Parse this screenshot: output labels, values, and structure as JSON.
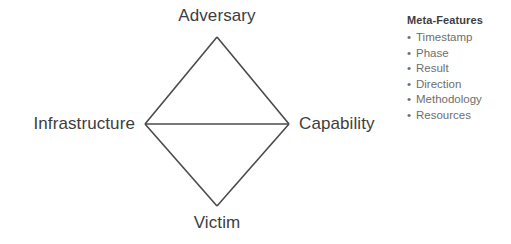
{
  "diagram": {
    "line_color": "#4a4a4c",
    "text_color": "#3d3d3f",
    "background_color": "#ffffff",
    "nodes": {
      "top": "Adversary",
      "left": "Infrastructure",
      "right": "Capability",
      "bottom": "Victim"
    },
    "edges": [
      {
        "from": "Infrastructure",
        "to": "Adversary"
      },
      {
        "from": "Adversary",
        "to": "Capability"
      },
      {
        "from": "Capability",
        "to": "Victim"
      },
      {
        "from": "Victim",
        "to": "Infrastructure"
      },
      {
        "from": "Infrastructure",
        "to": "Capability"
      }
    ]
  },
  "meta_features": {
    "title": "Meta-Features",
    "bullet_glyph": "•",
    "text_color": "#6e6e70",
    "items": [
      {
        "label": "Timestamp"
      },
      {
        "label": "Phase"
      },
      {
        "label": "Result"
      },
      {
        "label": "Direction"
      },
      {
        "label": "Methodology"
      },
      {
        "label": "Resources"
      }
    ]
  }
}
